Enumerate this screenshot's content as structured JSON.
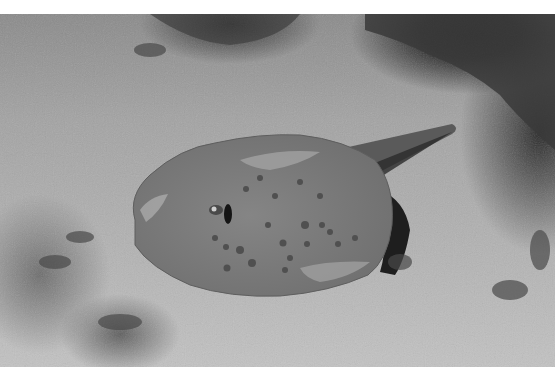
{
  "image": {
    "subject": "blue-spotted stingray resting on sandy seafloor",
    "tone": "grayscale",
    "colors": {
      "sand": "#b0b0b0",
      "ray_body": "#7e7e7e",
      "ray_spots": "#555555",
      "shadow": "#1e1e1e",
      "border": "#ffffff"
    }
  }
}
